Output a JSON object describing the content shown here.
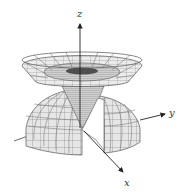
{
  "figure": {
    "axes": {
      "x": {
        "label": "x"
      },
      "y": {
        "label": "y"
      },
      "z": {
        "label": "z"
      }
    },
    "colors": {
      "surface_fill": "#e6e6e6",
      "inner_fill": "#d2d2d2",
      "mesh_line": "#6e6e6e",
      "axis_line": "#333333",
      "background": "#ffffff"
    }
  }
}
